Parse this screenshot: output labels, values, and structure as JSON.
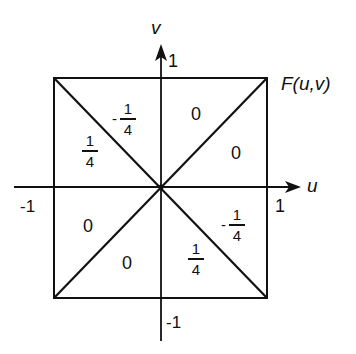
{
  "diagram": {
    "function_label": "F(u,v)",
    "axes": {
      "horizontal": {
        "label": "u",
        "pos_tick": "1",
        "neg_tick": "-1"
      },
      "vertical": {
        "label": "v",
        "pos_tick": "1",
        "neg_tick": "-1"
      }
    },
    "regions": [
      {
        "id": "upper-left-inner",
        "sign": "-",
        "numerator": "1",
        "denominator": "4"
      },
      {
        "id": "upper-left-outer",
        "sign": "",
        "numerator": "1",
        "denominator": "4"
      },
      {
        "id": "upper-right-inner",
        "value": "0"
      },
      {
        "id": "upper-right-outer",
        "value": "0"
      },
      {
        "id": "lower-left-outer",
        "value": "0"
      },
      {
        "id": "lower-left-inner",
        "value": "0"
      },
      {
        "id": "lower-right-inner",
        "sign": "",
        "numerator": "1",
        "denominator": "4"
      },
      {
        "id": "lower-right-outer",
        "sign": "-",
        "numerator": "1",
        "denominator": "4"
      }
    ],
    "colors": {
      "ink": "#111111",
      "background": "#ffffff"
    }
  }
}
